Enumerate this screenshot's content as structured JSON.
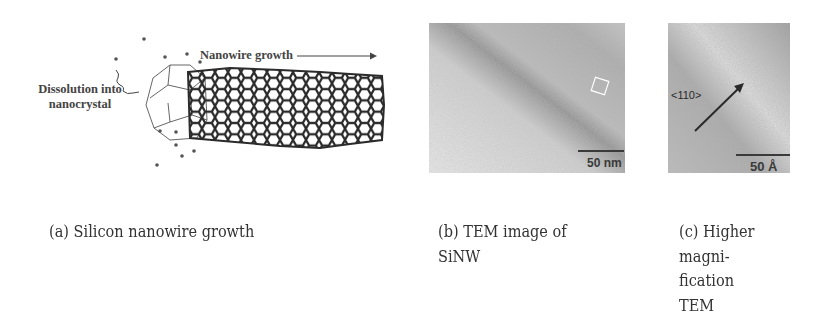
{
  "figures": {
    "a": {
      "labels": {
        "dissolution_line1": "Dissolution into",
        "dissolution_line2": "nanocrystal",
        "growth": "Nanowire growth"
      },
      "caption": "(a) Silicon nanowire growth"
    },
    "b": {
      "scale_label": "50 nm",
      "caption": "(b) TEM image of SiNW"
    },
    "c": {
      "direction_label": "<110>",
      "scale_label": "50 Å",
      "caption": "(c) Higher magni-fication TEM"
    }
  }
}
